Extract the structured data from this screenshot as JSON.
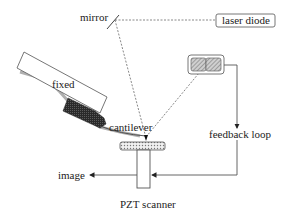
{
  "diagram": {
    "type": "atomic-force-microscope-schematic",
    "labels": {
      "mirror": "mirror",
      "laser_diode": "laser diode",
      "fixed": "fixed",
      "cantilever": "cantilever",
      "feedback_loop": "feedback loop",
      "image": "image",
      "pzt_scanner": "PZT scanner"
    },
    "components": [
      {
        "id": "mirror",
        "label": "mirror"
      },
      {
        "id": "laser-diode",
        "label": "laser diode"
      },
      {
        "id": "photodetector",
        "label": ""
      },
      {
        "id": "fixed-support",
        "label": "fixed"
      },
      {
        "id": "cantilever",
        "label": "cantilever"
      },
      {
        "id": "sample",
        "label": ""
      },
      {
        "id": "pzt-scanner",
        "label": "PZT scanner"
      }
    ],
    "connections": [
      {
        "from": "laser-diode",
        "to": "mirror",
        "style": "dashed"
      },
      {
        "from": "mirror",
        "to": "cantilever",
        "style": "dashed"
      },
      {
        "from": "cantilever",
        "to": "photodetector",
        "style": "dashed"
      },
      {
        "from": "photodetector",
        "to": "feedback loop",
        "style": "solid-arrow"
      },
      {
        "from": "feedback loop",
        "to": "pzt-scanner",
        "style": "solid-arrow"
      },
      {
        "from": "pzt-scanner",
        "to": "image",
        "style": "solid-arrow"
      }
    ],
    "colors": {
      "line": "#555555",
      "dashed": "#777777",
      "block_dark": "#333333",
      "hatch": "#9a9a9a",
      "shadow": "#b0b0b0"
    }
  }
}
